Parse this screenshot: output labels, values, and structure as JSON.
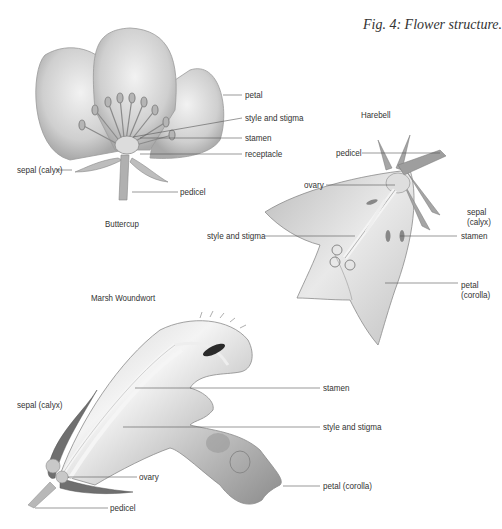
{
  "figure": {
    "title": "Fig. 4: Flower structure."
  },
  "buttercup": {
    "name": "Buttercup",
    "labels": {
      "petal": "petal",
      "style_and_stigma": "style and stigma",
      "stamen": "stamen",
      "receptacle": "receptacle",
      "sepal": "sepal (calyx)",
      "pedicel": "pedicel"
    }
  },
  "harebell": {
    "name": "Harebell",
    "labels": {
      "pedicel": "pedicel",
      "ovary": "ovary",
      "sepal_line1": "sepal",
      "sepal_line2": "(calyx)",
      "style_and_stigma": "style and stigma",
      "stamen": "stamen",
      "petal_line1": "petal",
      "petal_line2": "(corolla)"
    }
  },
  "marsh_woundwort": {
    "name": "Marsh Woundwort",
    "labels": {
      "sepal": "sepal (calyx)",
      "stamen": "stamen",
      "style_and_stigma": "style and stigma",
      "ovary": "ovary",
      "petal": "petal (corolla)",
      "pedicel": "pedicel"
    }
  },
  "colors": {
    "background": "#ffffff",
    "leader_line": "#555555",
    "illustration_shade": "#9a9a9a",
    "woundwort_dark": "#6a6a6a"
  }
}
